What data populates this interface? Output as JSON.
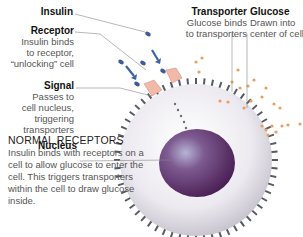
{
  "labels": {
    "insulin": {
      "title": "Insulin"
    },
    "receptor": {
      "title": "Receptor",
      "text": [
        "Insulin binds",
        "to receptor,",
        "“unlocking” cell"
      ]
    },
    "signal": {
      "title": "Signal",
      "text": [
        "Passes to",
        "cell nucleus,",
        "triggering",
        "transporters"
      ]
    },
    "nucleus": {
      "title": "Nucleus"
    },
    "transporter": {
      "title": "Transporter",
      "text": [
        "Glucose binds",
        "to transporters"
      ]
    },
    "glucose": {
      "title": "Glucose",
      "text": [
        "Drawn into",
        "center of cell"
      ]
    }
  },
  "caption": {
    "title": "NORMAL RECEPTORS",
    "text": "Insulin binds with receptors on a cell to allow glucose to enter the cell. This triggers transporters within the cell to draw glucose inside."
  },
  "colors": {
    "nucleus": "#5e2f6e",
    "cell": "#e9e7ee",
    "receptor": "#f2b8a8",
    "insulin": "#3d5a9a",
    "glucose": "#e8a060",
    "arrow": "#3b63a8",
    "spikes": "#555a66"
  }
}
